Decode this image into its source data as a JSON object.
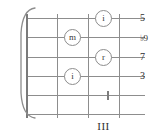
{
  "diagram": {
    "kind": "guitar-chord-fretboard-diagram",
    "position_label": "III",
    "string_count": 6,
    "fret_count": 4,
    "barre": {
      "present": true,
      "symbol": "brace",
      "spans_all_strings": true
    },
    "finger_markers": [
      {
        "label": "i",
        "string_index": 0,
        "fret_index": 3
      },
      {
        "label": "m",
        "string_index": 1,
        "fret_index": 2
      },
      {
        "label": "r",
        "string_index": 2,
        "fret_index": 3
      },
      {
        "label": "i",
        "string_index": 3,
        "fret_index": 2
      }
    ],
    "tick_markers": [
      {
        "string_index": 4,
        "fret_index": 3
      }
    ],
    "interval_labels": [
      {
        "text": "5",
        "string_index": 0
      },
      {
        "text": "♭9",
        "string_index": 1
      },
      {
        "text": "7",
        "string_index": 2
      },
      {
        "text": "3",
        "string_index": 3
      }
    ],
    "colors": {
      "line": "#8d8d8d",
      "nut": "#7a7a7a",
      "text": "#2e2e2e",
      "background": "#ffffff"
    }
  }
}
